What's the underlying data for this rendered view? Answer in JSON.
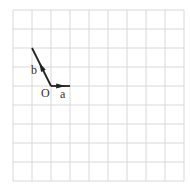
{
  "grid": {
    "cols": 9,
    "rows": 9,
    "cell": 19,
    "origin_px": [
      13,
      10
    ],
    "line_color": "#d8d8d8"
  },
  "points": {
    "O": {
      "label": "O",
      "grid": [
        2,
        4
      ]
    }
  },
  "vectors": [
    {
      "name": "a",
      "label": "a",
      "from": [
        2,
        4
      ],
      "to": [
        3,
        4
      ]
    },
    {
      "name": "b",
      "label": "b",
      "from": [
        2,
        4
      ],
      "to": [
        1,
        2
      ]
    }
  ],
  "colors": {
    "vector": "#222222",
    "text": "#333333"
  }
}
